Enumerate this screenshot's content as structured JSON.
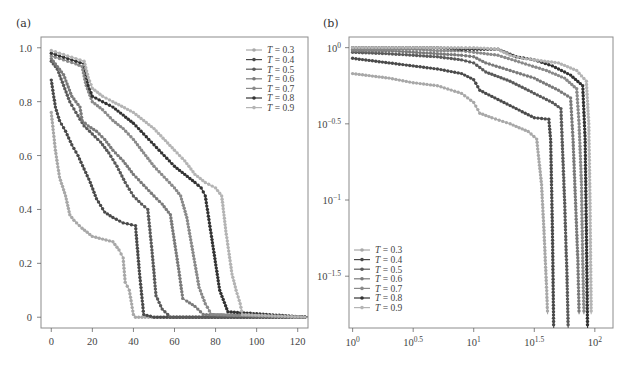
{
  "panels": {
    "a": {
      "label": "(a)"
    },
    "b": {
      "label": "(b)"
    }
  },
  "chart_data": [
    {
      "panel": "(a)",
      "type": "line",
      "title": "",
      "xlabel": "",
      "ylabel": "",
      "xlim": [
        -5,
        125
      ],
      "ylim": [
        -0.04,
        1.04
      ],
      "xticks": [
        0,
        20,
        40,
        60,
        80,
        100,
        120
      ],
      "xtick_labels": [
        "0",
        "20",
        "40",
        "60",
        "80",
        "100",
        "120"
      ],
      "yticks": [
        0,
        0.2,
        0.4,
        0.6,
        0.8,
        1.0
      ],
      "ytick_labels": [
        "0",
        "0.2",
        "0.4",
        "0.6",
        "0.8",
        "1.0"
      ],
      "grid": false,
      "legend_position": "upper right",
      "series": [
        {
          "name": "T = 0.3",
          "color": "#a8a8a8",
          "x": [
            0,
            2,
            4,
            7,
            9,
            11,
            15,
            20,
            25,
            30,
            33,
            35,
            36,
            38,
            40,
            41,
            60,
            90,
            125
          ],
          "y": [
            0.76,
            0.62,
            0.52,
            0.45,
            0.38,
            0.36,
            0.33,
            0.3,
            0.29,
            0.28,
            0.25,
            0.22,
            0.13,
            0.1,
            0.01,
            0.0,
            0.0,
            0.0,
            0.0
          ]
        },
        {
          "name": "T = 0.4",
          "color": "#4a4a4a",
          "x": [
            0,
            2,
            4,
            7,
            10,
            13,
            16,
            19,
            22,
            26,
            30,
            35,
            41,
            43,
            45,
            50,
            125
          ],
          "y": [
            0.88,
            0.78,
            0.73,
            0.69,
            0.64,
            0.6,
            0.55,
            0.5,
            0.44,
            0.39,
            0.37,
            0.35,
            0.34,
            0.16,
            0.01,
            0.0,
            0.0
          ]
        },
        {
          "name": "T = 0.5",
          "color": "#5a5a5a",
          "x": [
            0,
            3,
            6,
            9,
            12,
            16,
            20,
            24,
            28,
            32,
            36,
            40,
            44,
            47,
            49,
            51,
            54,
            58,
            125
          ],
          "y": [
            0.95,
            0.92,
            0.86,
            0.8,
            0.76,
            0.71,
            0.68,
            0.65,
            0.61,
            0.56,
            0.5,
            0.45,
            0.42,
            0.4,
            0.25,
            0.08,
            0.03,
            0.0,
            0.0
          ]
        },
        {
          "name": "T = 0.6",
          "color": "#7a7a7a",
          "x": [
            0,
            3,
            6,
            10,
            14,
            15,
            18,
            22,
            26,
            30,
            35,
            40,
            45,
            50,
            54,
            58,
            62,
            64,
            66,
            70,
            74,
            125
          ],
          "y": [
            0.96,
            0.93,
            0.9,
            0.82,
            0.78,
            0.73,
            0.71,
            0.69,
            0.66,
            0.62,
            0.58,
            0.53,
            0.49,
            0.45,
            0.42,
            0.38,
            0.18,
            0.07,
            0.06,
            0.04,
            0.01,
            0.0
          ]
        },
        {
          "name": "T = 0.7",
          "color": "#8a8a8a",
          "x": [
            0,
            4,
            8,
            12,
            15,
            17,
            20,
            25,
            30,
            35,
            40,
            45,
            50,
            55,
            60,
            63,
            66,
            69,
            72,
            75,
            78,
            125
          ],
          "y": [
            0.97,
            0.96,
            0.95,
            0.94,
            0.93,
            0.86,
            0.8,
            0.77,
            0.73,
            0.7,
            0.66,
            0.61,
            0.56,
            0.52,
            0.48,
            0.45,
            0.37,
            0.24,
            0.11,
            0.05,
            0.01,
            0.0
          ]
        },
        {
          "name": "T = 0.8",
          "color": "#333333",
          "x": [
            0,
            4,
            8,
            12,
            16,
            18,
            20,
            25,
            30,
            35,
            40,
            45,
            50,
            55,
            60,
            65,
            70,
            73,
            75,
            78,
            82,
            86,
            125
          ],
          "y": [
            0.98,
            0.97,
            0.96,
            0.95,
            0.94,
            0.86,
            0.82,
            0.8,
            0.78,
            0.75,
            0.72,
            0.68,
            0.64,
            0.6,
            0.56,
            0.53,
            0.5,
            0.48,
            0.45,
            0.3,
            0.1,
            0.02,
            0.0
          ]
        },
        {
          "name": "T = 0.9",
          "color": "#b4b4b4",
          "x": [
            0,
            4,
            8,
            12,
            16,
            18,
            20,
            25,
            30,
            40,
            50,
            60,
            65,
            70,
            75,
            80,
            83,
            85,
            88,
            90,
            92,
            93,
            125
          ],
          "y": [
            0.99,
            0.98,
            0.97,
            0.96,
            0.95,
            0.89,
            0.85,
            0.82,
            0.8,
            0.76,
            0.7,
            0.62,
            0.58,
            0.53,
            0.5,
            0.48,
            0.45,
            0.32,
            0.16,
            0.1,
            0.05,
            0.01,
            0.0
          ]
        }
      ]
    },
    {
      "panel": "(b)",
      "type": "line",
      "title": "",
      "xlabel": "",
      "ylabel": "",
      "xscale": "log",
      "yscale": "log",
      "xlim_log10": [
        -0.03,
        2.15
      ],
      "ylim_log10": [
        -1.84,
        0.07
      ],
      "xticks_log10": [
        0,
        0.5,
        1,
        1.5,
        2
      ],
      "xtick_labels": [
        "10^0",
        "10^0.5",
        "10^1",
        "10^1.5",
        "10^2"
      ],
      "yticks_log10": [
        -1.5,
        -1,
        -0.5,
        0
      ],
      "ytick_labels": [
        "10^-1.5",
        "10^-1",
        "10^-0.5",
        "10^0"
      ],
      "grid": false,
      "legend_position": "lower left",
      "series": [
        {
          "name": "T = 0.3",
          "color": "#a8a8a8",
          "x_log10": [
            0,
            0.3,
            0.5,
            0.7,
            0.9,
            1.0,
            1.05,
            1.15,
            1.3,
            1.45,
            1.52,
            1.56,
            1.58,
            1.6,
            1.61
          ],
          "y_log10": [
            -0.17,
            -0.2,
            -0.23,
            -0.25,
            -0.3,
            -0.36,
            -0.43,
            -0.46,
            -0.5,
            -0.55,
            -0.6,
            -0.9,
            -1.2,
            -1.55,
            -1.75
          ]
        },
        {
          "name": "T = 0.4",
          "color": "#4a4a4a",
          "x_log10": [
            0,
            0.3,
            0.5,
            0.7,
            0.9,
            1.0,
            1.05,
            1.15,
            1.3,
            1.5,
            1.62,
            1.635,
            1.65,
            1.66
          ],
          "y_log10": [
            -0.07,
            -0.1,
            -0.12,
            -0.14,
            -0.17,
            -0.21,
            -0.28,
            -0.32,
            -0.38,
            -0.46,
            -0.47,
            -0.6,
            -1.2,
            -1.84
          ]
        },
        {
          "name": "T = 0.5",
          "color": "#5a5a5a",
          "x_log10": [
            0,
            0.3,
            0.5,
            0.7,
            0.9,
            1.0,
            1.1,
            1.3,
            1.5,
            1.65,
            1.72,
            1.73,
            1.75,
            1.77,
            1.78
          ],
          "y_log10": [
            -0.03,
            -0.04,
            -0.05,
            -0.06,
            -0.08,
            -0.1,
            -0.16,
            -0.22,
            -0.3,
            -0.36,
            -0.4,
            -0.6,
            -1.0,
            -1.5,
            -1.84
          ]
        },
        {
          "name": "T = 0.6",
          "color": "#7a7a7a",
          "x_log10": [
            0,
            0.3,
            0.5,
            0.7,
            0.9,
            1.0,
            1.1,
            1.3,
            1.5,
            1.7,
            1.8,
            1.82,
            1.84,
            1.86,
            1.87
          ],
          "y_log10": [
            -0.02,
            -0.02,
            -0.03,
            -0.04,
            -0.05,
            -0.06,
            -0.1,
            -0.15,
            -0.2,
            -0.28,
            -0.33,
            -0.6,
            -1.0,
            -1.4,
            -1.75
          ]
        },
        {
          "name": "T = 0.7",
          "color": "#8a8a8a",
          "x_log10": [
            0,
            0.3,
            0.5,
            0.7,
            0.9,
            1.0,
            1.2,
            1.4,
            1.6,
            1.75,
            1.85,
            1.87,
            1.89,
            1.9,
            1.91
          ],
          "y_log10": [
            -0.01,
            -0.01,
            -0.01,
            -0.02,
            -0.02,
            -0.03,
            -0.05,
            -0.1,
            -0.15,
            -0.2,
            -0.27,
            -0.5,
            -0.9,
            -1.4,
            -1.75
          ]
        },
        {
          "name": "T = 0.8",
          "color": "#333333",
          "x_log10": [
            0,
            0.3,
            0.5,
            0.7,
            0.9,
            1.0,
            1.2,
            1.35,
            1.5,
            1.65,
            1.8,
            1.9,
            1.92,
            1.93,
            1.94
          ],
          "y_log10": [
            0,
            0,
            0,
            0,
            -0.01,
            -0.01,
            -0.01,
            -0.06,
            -0.08,
            -0.12,
            -0.18,
            -0.25,
            -0.6,
            -1.2,
            -1.84
          ]
        },
        {
          "name": "T = 0.9",
          "color": "#b4b4b4",
          "x_log10": [
            0,
            0.3,
            0.5,
            0.7,
            0.9,
            1.0,
            1.2,
            1.3,
            1.4,
            1.5,
            1.7,
            1.85,
            1.93,
            1.95,
            1.96,
            1.97
          ],
          "y_log10": [
            0,
            0,
            0,
            0,
            0,
            0,
            -0.01,
            -0.05,
            -0.07,
            -0.08,
            -0.1,
            -0.15,
            -0.22,
            -0.5,
            -1.0,
            -1.75
          ]
        }
      ]
    }
  ]
}
